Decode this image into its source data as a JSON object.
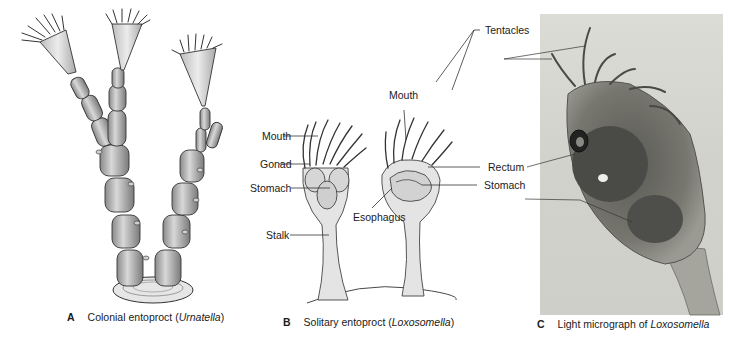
{
  "figure": {
    "panels": [
      {
        "letter": "A",
        "caption_prefix": "Colonial entoproct (",
        "caption_italic": "Urnatella",
        "caption_suffix": ")",
        "type": "illustration",
        "labels": []
      },
      {
        "letter": "B",
        "caption_prefix": "Solitary entoproct (",
        "caption_italic": "Loxosomella",
        "caption_suffix": ")",
        "type": "illustration",
        "labels": {
          "mouth_left": "Mouth",
          "gonad": "Gonad",
          "stomach_left": "Stomach",
          "stalk": "Stalk",
          "mouth_right": "Mouth",
          "esophagus": "Esophagus"
        }
      },
      {
        "letter": "C",
        "caption_prefix": "Light micrograph of ",
        "caption_italic": "Loxosomella",
        "caption_suffix": "",
        "type": "micrograph",
        "labels": {
          "tentacles": "Tentacles",
          "rectum": "Rectum",
          "stomach": "Stomach"
        }
      }
    ]
  }
}
